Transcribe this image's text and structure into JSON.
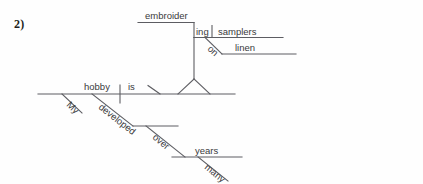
{
  "page": {
    "item_number": "2)",
    "background_color": "#fefefe",
    "line_color": "#5d5d62",
    "text_color": "#3a3a3c"
  },
  "diagram": {
    "type": "reed-kellogg-sentence-diagram",
    "sentence": "My hobby is embroidering samplers on linen developed over many years",
    "words": {
      "subject": "hobby",
      "subject_modifier": "My",
      "verb": "is",
      "gerund_stem": "embroider",
      "gerund_suffix": "ing",
      "gerund_object": "samplers",
      "preposition_on": "on",
      "prep_object_linen": "linen",
      "participle": "developed",
      "preposition_over": "over",
      "prep_object_years": "years",
      "years_modifier": "many"
    },
    "labels": [
      {
        "id": "embroider",
        "text": "embroider"
      },
      {
        "id": "ing",
        "text": "ing"
      },
      {
        "id": "samplers",
        "text": "samplers"
      },
      {
        "id": "on",
        "text": "on"
      },
      {
        "id": "linen",
        "text": "linen"
      },
      {
        "id": "hobby",
        "text": "hobby"
      },
      {
        "id": "is",
        "text": "is"
      },
      {
        "id": "my",
        "text": "My"
      },
      {
        "id": "developed",
        "text": "developed"
      },
      {
        "id": "over",
        "text": "over"
      },
      {
        "id": "years",
        "text": "years"
      },
      {
        "id": "many",
        "text": "many"
      }
    ]
  }
}
